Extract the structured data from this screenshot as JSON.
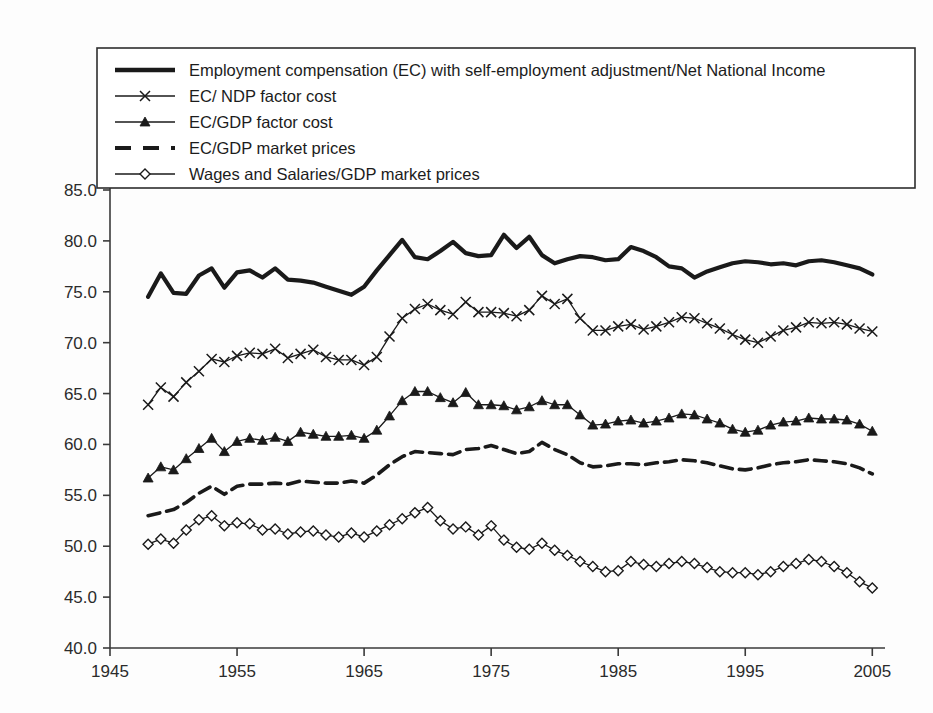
{
  "chart_data": {
    "type": "line",
    "title": "",
    "subtitle": "",
    "xlabel": "",
    "ylabel": "",
    "xlim": [
      1945,
      2006
    ],
    "ylim": [
      40.0,
      85.0
    ],
    "xticks": [
      1945,
      1955,
      1965,
      1975,
      1985,
      1995,
      2005
    ],
    "xtick_labels": [
      "1945",
      "1955",
      "1965",
      "1975",
      "1985",
      "1995",
      "2005"
    ],
    "yticks": [
      40.0,
      45.0,
      50.0,
      55.0,
      60.0,
      65.0,
      70.0,
      75.0,
      80.0,
      85.0
    ],
    "ytick_labels": [
      "40.0",
      "45.0",
      "50.0",
      "55.0",
      "60.0",
      "65.0",
      "70.0",
      "75.0",
      "80.0",
      "85.0"
    ],
    "grid": false,
    "legend_position": "top-left-inside",
    "x": [
      1948,
      1949,
      1950,
      1951,
      1952,
      1953,
      1954,
      1955,
      1956,
      1957,
      1958,
      1959,
      1960,
      1961,
      1962,
      1963,
      1964,
      1965,
      1966,
      1967,
      1968,
      1969,
      1970,
      1971,
      1972,
      1973,
      1974,
      1975,
      1976,
      1977,
      1978,
      1979,
      1980,
      1981,
      1982,
      1983,
      1984,
      1985,
      1986,
      1987,
      1988,
      1989,
      1990,
      1991,
      1992,
      1993,
      1994,
      1995,
      1996,
      1997,
      1998,
      1999,
      2000,
      2001,
      2002,
      2003,
      2004,
      2005
    ],
    "series": [
      {
        "name": "Employment compensation (EC) with self-employment adjustment/Net National Income",
        "marker": "none",
        "linestyle": "solid-thick",
        "color": "#1a1a1a",
        "values": [
          74.5,
          76.8,
          74.9,
          74.8,
          76.6,
          77.3,
          75.4,
          76.9,
          77.1,
          76.4,
          77.3,
          76.2,
          76.1,
          75.9,
          75.5,
          75.1,
          74.7,
          75.5,
          77.1,
          78.6,
          80.1,
          78.4,
          78.2,
          79.0,
          79.9,
          78.8,
          78.5,
          78.6,
          80.6,
          79.3,
          80.4,
          78.6,
          77.8,
          78.2,
          78.5,
          78.4,
          78.1,
          78.2,
          79.4,
          79.0,
          78.4,
          77.5,
          77.3,
          76.4,
          77.0,
          77.4,
          77.8,
          78.0,
          77.9,
          77.7,
          77.8,
          77.6,
          78.0,
          78.1,
          77.9,
          77.6,
          77.3,
          76.7
        ]
      },
      {
        "name": "EC/ NDP factor cost",
        "marker": "x",
        "linestyle": "solid",
        "color": "#1a1a1a",
        "values": [
          63.9,
          65.6,
          64.7,
          66.1,
          67.2,
          68.4,
          68.1,
          68.7,
          69.0,
          68.9,
          69.4,
          68.5,
          68.9,
          69.3,
          68.6,
          68.3,
          68.3,
          67.8,
          68.6,
          70.6,
          72.4,
          73.3,
          73.8,
          73.2,
          72.8,
          74.0,
          73.0,
          73.0,
          72.9,
          72.6,
          73.2,
          74.6,
          73.8,
          74.3,
          72.4,
          71.2,
          71.2,
          71.6,
          71.8,
          71.3,
          71.6,
          72.0,
          72.5,
          72.4,
          71.9,
          71.4,
          70.8,
          70.3,
          70.0,
          70.6,
          71.2,
          71.5,
          72.0,
          71.9,
          72.0,
          71.8,
          71.4,
          71.1
        ]
      },
      {
        "name": "EC/GDP factor cost",
        "marker": "triangle",
        "linestyle": "solid",
        "color": "#1a1a1a",
        "values": [
          56.7,
          57.8,
          57.5,
          58.6,
          59.6,
          60.6,
          59.3,
          60.3,
          60.6,
          60.4,
          60.7,
          60.3,
          61.2,
          61.0,
          60.8,
          60.8,
          60.9,
          60.6,
          61.4,
          62.8,
          64.3,
          65.2,
          65.2,
          64.6,
          64.1,
          65.1,
          63.9,
          63.9,
          63.8,
          63.4,
          63.7,
          64.3,
          63.9,
          63.9,
          62.9,
          61.9,
          62.0,
          62.3,
          62.4,
          62.1,
          62.3,
          62.6,
          63.0,
          62.9,
          62.5,
          62.1,
          61.5,
          61.2,
          61.4,
          61.9,
          62.2,
          62.3,
          62.6,
          62.5,
          62.5,
          62.4,
          62.0,
          61.3
        ]
      },
      {
        "name": "EC/GDP market prices",
        "marker": "none",
        "linestyle": "dashed",
        "color": "#1a1a1a",
        "values": [
          53.0,
          53.3,
          53.6,
          54.3,
          55.2,
          55.9,
          55.1,
          55.9,
          56.1,
          56.1,
          56.2,
          56.1,
          56.4,
          56.3,
          56.2,
          56.2,
          56.4,
          56.2,
          57.0,
          58.0,
          58.8,
          59.3,
          59.2,
          59.1,
          59.0,
          59.5,
          59.6,
          59.9,
          59.5,
          59.1,
          59.3,
          60.2,
          59.5,
          59.0,
          58.2,
          57.8,
          57.9,
          58.1,
          58.1,
          58.0,
          58.2,
          58.3,
          58.5,
          58.4,
          58.2,
          57.9,
          57.6,
          57.5,
          57.7,
          58.0,
          58.2,
          58.3,
          58.5,
          58.4,
          58.3,
          58.1,
          57.7,
          57.1
        ]
      },
      {
        "name": "Wages and Salaries/GDP market prices",
        "marker": "diamond",
        "linestyle": "solid",
        "color": "#1a1a1a",
        "values": [
          50.2,
          50.7,
          50.3,
          51.6,
          52.6,
          53.0,
          52.0,
          52.3,
          52.2,
          51.6,
          51.7,
          51.2,
          51.4,
          51.5,
          51.1,
          50.9,
          51.3,
          50.9,
          51.5,
          52.1,
          52.7,
          53.3,
          53.8,
          52.5,
          51.7,
          51.9,
          51.1,
          52.0,
          50.6,
          49.9,
          49.7,
          50.3,
          49.6,
          49.1,
          48.5,
          48.0,
          47.5,
          47.6,
          48.5,
          48.2,
          48.0,
          48.3,
          48.5,
          48.3,
          47.9,
          47.5,
          47.4,
          47.4,
          47.2,
          47.5,
          48.0,
          48.3,
          48.7,
          48.5,
          48.0,
          47.4,
          46.5,
          45.9
        ]
      }
    ]
  },
  "legend": {
    "entries": [
      {
        "label": "Employment compensation (EC) with self-employment adjustment/Net National Income",
        "style": "solid-thick",
        "marker": "none"
      },
      {
        "label": "EC/ NDP factor cost",
        "style": "solid",
        "marker": "x"
      },
      {
        "label": "EC/GDP factor cost",
        "style": "solid",
        "marker": "triangle"
      },
      {
        "label": "EC/GDP market prices",
        "style": "dashed",
        "marker": "none"
      },
      {
        "label": "Wages and Salaries/GDP market prices",
        "style": "solid",
        "marker": "diamond"
      }
    ]
  },
  "colors": {
    "ink": "#1a1a1a",
    "axis": "#3a3a3a",
    "background": "#fdfdfd"
  }
}
